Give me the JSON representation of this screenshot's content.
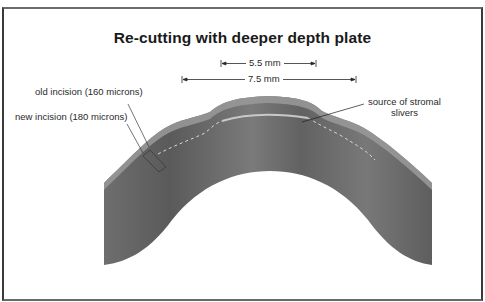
{
  "diagram": {
    "title": "Re-cutting with deeper depth plate",
    "dimensions": [
      {
        "label": "5.5 mm",
        "span_px": [
          221,
          316
        ]
      },
      {
        "label": "7.5 mm",
        "span_px": [
          182,
          356
        ]
      }
    ],
    "labels": {
      "old_incision": "old incision (160 microns)",
      "new_incision": "new incision (180 microns)",
      "stromal_source_line1": "source of stromal",
      "stromal_source_line2": "slivers"
    },
    "colors": {
      "frame": "#3a3a3a",
      "tissue_dark": "#5c5c5c",
      "tissue_mid": "#7a7a7a",
      "epithelium": "#9a9a9a",
      "text": "#1a1a1a"
    }
  }
}
